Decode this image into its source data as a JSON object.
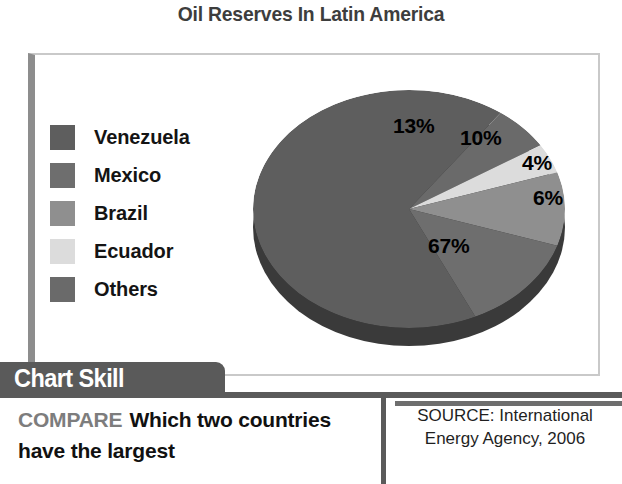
{
  "chart": {
    "title": "Oil Reserves In Latin America"
  },
  "legend": {
    "items": [
      {
        "label": "Venezuela",
        "color": "#5e5e5e"
      },
      {
        "label": "Mexico",
        "color": "#6e6e6e"
      },
      {
        "label": "Brazil",
        "color": "#8f8f8f"
      },
      {
        "label": "Ecuador",
        "color": "#dcdcdc"
      },
      {
        "label": "Others",
        "color": "#6a6a6a"
      }
    ]
  },
  "pie_labels": {
    "venezuela": "67%",
    "mexico": "13%",
    "brazil": "10%",
    "ecuador": "4%",
    "others": "6%"
  },
  "chart_skill": {
    "tab_label": "Chart Skill",
    "compare_tag": "COMPARE",
    "question": "Which two countries have the largest"
  },
  "source": {
    "line1": "SOURCE: International",
    "line2": "Energy Agency, 2006"
  },
  "chart_data": {
    "type": "pie",
    "title": "Oil Reserves In Latin America",
    "categories": [
      "Venezuela",
      "Mexico",
      "Brazil",
      "Ecuador",
      "Others"
    ],
    "values": [
      67,
      13,
      10,
      4,
      6
    ],
    "value_labels": [
      "67%",
      "13%",
      "10%",
      "4%",
      "6%"
    ],
    "colors": [
      "#5e5e5e",
      "#6e6e6e",
      "#8f8f8f",
      "#dcdcdc",
      "#6a6a6a"
    ],
    "units": "percent",
    "legend_position": "left",
    "three_d": true,
    "source": "SOURCE: International Energy Agency, 2006"
  }
}
